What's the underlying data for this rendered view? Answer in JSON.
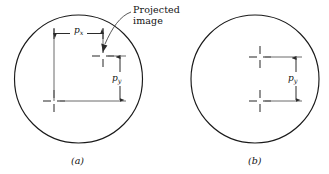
{
  "figure": {
    "type": "technical-diagram",
    "background_color": "#ffffff",
    "line_color": "#1a1a1a",
    "mark_color": "#6e6e6e",
    "width": 329,
    "height": 174
  },
  "annotations": {
    "projected_image_line1": "Projected",
    "projected_image_line2": "image",
    "px_label": "p",
    "px_subscript": "x",
    "py_label": "p",
    "py_subscript": "y"
  },
  "panels": [
    {
      "id": "a",
      "caption": "(a)",
      "caption_text": "(a)",
      "circle": {
        "cx": 78.5,
        "cy": 79,
        "r": 64
      },
      "marks": [
        {
          "name": "lower-left-crosshair",
          "x": 54,
          "y": 101
        },
        {
          "name": "upper-right-crosshair",
          "x": 103,
          "y": 56
        }
      ],
      "dimensions": [
        {
          "name": "px",
          "label": "p",
          "subscript": "x",
          "orientation": "horizontal",
          "from_x": 54,
          "to_x": 103,
          "y": 33
        },
        {
          "name": "py",
          "label": "p",
          "subscript": "y",
          "orientation": "vertical",
          "from_y": 56,
          "to_y": 101,
          "x": 120
        }
      ]
    },
    {
      "id": "b",
      "caption": "(b)",
      "caption_text": "(b)",
      "circle": {
        "cx": 255,
        "cy": 79,
        "r": 64
      },
      "marks": [
        {
          "name": "upper-crosshair",
          "x": 260,
          "y": 57
        },
        {
          "name": "lower-crosshair",
          "x": 260,
          "y": 101
        }
      ],
      "dimensions": [
        {
          "name": "py",
          "label": "p",
          "subscript": "y",
          "orientation": "vertical",
          "from_y": 57,
          "to_y": 101,
          "x": 296
        }
      ]
    }
  ]
}
